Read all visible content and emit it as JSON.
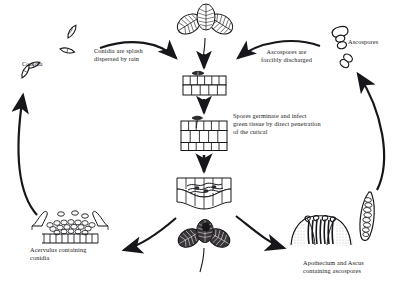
{
  "diagram": {
    "type": "disease-cycle",
    "background_color": "#ffffff",
    "ink_color": "#17161a"
  },
  "labels": {
    "conidia": "Conidia",
    "conidia_splash": "Conidia are splash\ndispersed by rain",
    "ascospores": "Ascospores",
    "ascospores_discharged": "Ascospores are\nforcibly discharged",
    "spores_germinate": "Spores germinate and infect\ngreen tissue by direct penetration\nof the cutical",
    "acervulus": "Acervulus containing\nconidia",
    "apothecium": "Apothecium and Ascus\ncontaining ascospores"
  },
  "structures": {
    "healthy_leaf": "trifoliate-clover-leaf",
    "infected_leaf": "diseased-clover-leaf",
    "epidermis_1": "leaf-cross-section-spore-landing",
    "epidermis_2": "leaf-cross-section-penetration",
    "epidermis_3": "leaf-cross-section-colonized",
    "acervulus_structure": "acervulus-with-conidiophores",
    "apothecium_structure": "apothecium-cup-with-asci",
    "ascus_structure": "elongate-ascus-with-ascospores",
    "conidia_spores": "curved-conidia-spores",
    "ascospore_spores": "two-celled-ascospores"
  },
  "arrows": {
    "splash_to_leaf": "conidia-splash-to-healthy-leaf",
    "discharge_to_leaf": "ascospore-discharge-to-healthy-leaf",
    "leaf_down_1": "leaf-to-epidermis-one",
    "epidermis_down_2": "epidermis-one-to-two",
    "epidermis_down_3": "epidermis-two-to-three",
    "to_acervulus": "infected-leaf-to-acervulus",
    "to_apothecium": "infected-leaf-to-apothecium",
    "acervulus_to_conidia": "acervulus-to-conidia",
    "ascus_to_ascospores": "ascus-to-ascospores"
  }
}
